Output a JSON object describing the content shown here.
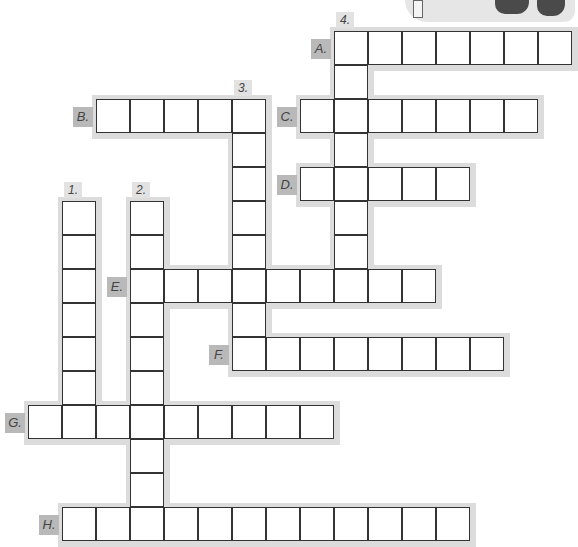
{
  "puzzle": {
    "type": "crossword",
    "cell_size": 34,
    "origin": {
      "x": 29,
      "y": 32
    },
    "colors": {
      "halo": "#dcdcdc",
      "letter_label_bg": "#b9b9b9",
      "number_label_bg": "#e2e2e2",
      "border": "#333333"
    },
    "across": [
      {
        "label": "A.",
        "row": 0,
        "col": 9,
        "length": 7
      },
      {
        "label": "B.",
        "row": 2,
        "col": 2,
        "length": 5
      },
      {
        "label": "C.",
        "row": 2,
        "col": 8,
        "length": 7
      },
      {
        "label": "D.",
        "row": 4,
        "col": 8,
        "length": 5
      },
      {
        "label": "E.",
        "row": 7,
        "col": 3,
        "length": 9
      },
      {
        "label": "F.",
        "row": 9,
        "col": 6,
        "length": 8
      },
      {
        "label": "G.",
        "row": 11,
        "col": 0,
        "length": 9
      },
      {
        "label": "H.",
        "row": 14,
        "col": 1,
        "length": 12
      }
    ],
    "down": [
      {
        "label": "1.",
        "row": 5,
        "col": 1,
        "length": 7
      },
      {
        "label": "2.",
        "row": 5,
        "col": 3,
        "length": 10
      },
      {
        "label": "3.",
        "row": 2,
        "col": 6,
        "length": 8
      },
      {
        "label": "4.",
        "row": 0,
        "col": 9,
        "length": 8
      }
    ]
  },
  "decoration": {
    "name": "shoes-and-book-illustration"
  }
}
